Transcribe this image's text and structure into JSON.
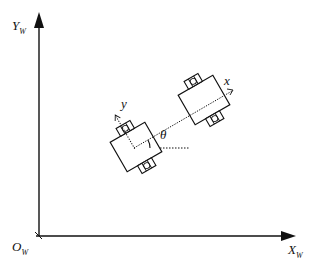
{
  "diagram": {
    "title": "",
    "axes": {
      "y_label": "Y",
      "y_sub": "W",
      "x_label": "X",
      "x_sub": "W",
      "origin_label": "O",
      "origin_sub": "W"
    },
    "robot_frame": {
      "x_label": "x",
      "y_label": "y",
      "angle_label": "θ"
    },
    "colors": {
      "stroke": "#111111",
      "background": "#ffffff"
    }
  }
}
